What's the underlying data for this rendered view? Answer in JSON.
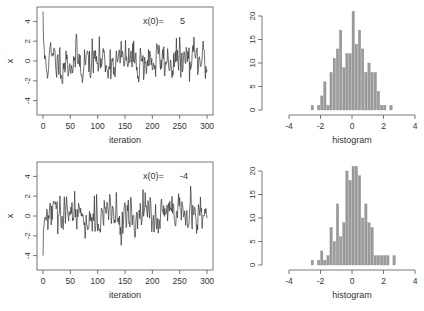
{
  "chart_data": [
    {
      "type": "line",
      "panel": "top-left",
      "title": "",
      "xlabel": "iteration",
      "ylabel": "x",
      "xlim": [
        0,
        300
      ],
      "ylim": [
        -5.5,
        5.5
      ],
      "xticks": [
        "0",
        "50",
        "100",
        "150",
        "200",
        "250",
        "300"
      ],
      "yticks": [
        "-4",
        "-2",
        "0",
        "2",
        "4"
      ],
      "annotation": {
        "label": "x(0)=",
        "value": "5"
      },
      "x0": 5,
      "seed": 11
    },
    {
      "type": "bar",
      "panel": "top-right",
      "xlabel": "histogram",
      "ylabel": "",
      "xlim": [
        -4,
        4
      ],
      "ylim": [
        0,
        21
      ],
      "xticks": [
        "-4",
        "-2",
        "0",
        "2",
        "4"
      ],
      "yticks": [
        "0",
        "5",
        "10",
        "15",
        "20"
      ],
      "bin_width": 0.2,
      "bins": [
        {
          "x": -3.2,
          "count": 1
        },
        {
          "x": -2.8,
          "count": 1
        },
        {
          "x": -2.6,
          "count": 3
        },
        {
          "x": -2.4,
          "count": 6
        },
        {
          "x": -2.2,
          "count": 1
        },
        {
          "x": -2.0,
          "count": 8
        },
        {
          "x": -1.8,
          "count": 11
        },
        {
          "x": -1.6,
          "count": 13
        },
        {
          "x": -1.4,
          "count": 17
        },
        {
          "x": -1.2,
          "count": 9
        },
        {
          "x": -1.0,
          "count": 12
        },
        {
          "x": -0.8,
          "count": 12
        },
        {
          "x": -0.6,
          "count": 21
        },
        {
          "x": -0.4,
          "count": 14
        },
        {
          "x": -0.2,
          "count": 17
        },
        {
          "x": 0.0,
          "count": 13
        },
        {
          "x": 0.2,
          "count": 8
        },
        {
          "x": 0.4,
          "count": 10
        },
        {
          "x": 0.6,
          "count": 8
        },
        {
          "x": 0.8,
          "count": 8
        },
        {
          "x": 1.0,
          "count": 4
        },
        {
          "x": 1.2,
          "count": 1
        },
        {
          "x": 1.4,
          "count": 1
        },
        {
          "x": 1.8,
          "count": 1
        }
      ]
    },
    {
      "type": "line",
      "panel": "bottom-left",
      "title": "",
      "xlabel": "iteration",
      "ylabel": "x",
      "xlim": [
        0,
        300
      ],
      "ylim": [
        -5.5,
        5.5
      ],
      "xticks": [
        "0",
        "50",
        "100",
        "150",
        "200",
        "250",
        "300"
      ],
      "yticks": [
        "-4",
        "-2",
        "0",
        "2",
        "4"
      ],
      "annotation": {
        "label": "x(0)=",
        "value": "-4"
      },
      "x0": -4,
      "seed": 29
    },
    {
      "type": "bar",
      "panel": "bottom-right",
      "xlabel": "histogram",
      "ylabel": "",
      "xlim": [
        -4,
        4
      ],
      "ylim": [
        0,
        21
      ],
      "xticks": [
        "-4",
        "-2",
        "0",
        "2",
        "4"
      ],
      "yticks": [
        "0",
        "5",
        "10",
        "15",
        "20"
      ],
      "bin_width": 0.2,
      "bins": [
        {
          "x": -3.2,
          "count": 1
        },
        {
          "x": -2.8,
          "count": 1
        },
        {
          "x": -2.6,
          "count": 3
        },
        {
          "x": -2.4,
          "count": 1
        },
        {
          "x": -2.2,
          "count": 2
        },
        {
          "x": -2.0,
          "count": 8
        },
        {
          "x": -1.8,
          "count": 5
        },
        {
          "x": -1.6,
          "count": 13
        },
        {
          "x": -1.4,
          "count": 6
        },
        {
          "x": -1.2,
          "count": 9
        },
        {
          "x": -1.0,
          "count": 20
        },
        {
          "x": -0.8,
          "count": 18
        },
        {
          "x": -0.6,
          "count": 21
        },
        {
          "x": -0.4,
          "count": 21
        },
        {
          "x": -0.2,
          "count": 19
        },
        {
          "x": 0.0,
          "count": 10
        },
        {
          "x": 0.2,
          "count": 13
        },
        {
          "x": 0.4,
          "count": 9
        },
        {
          "x": 0.6,
          "count": 8
        },
        {
          "x": 0.8,
          "count": 2
        },
        {
          "x": 1.0,
          "count": 2
        },
        {
          "x": 1.2,
          "count": 2
        },
        {
          "x": 1.4,
          "count": 2
        },
        {
          "x": 1.6,
          "count": 2
        },
        {
          "x": 2.0,
          "count": 2
        }
      ]
    }
  ]
}
